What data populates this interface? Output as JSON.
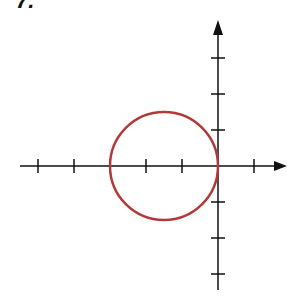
{
  "problem_label": "7.",
  "axes": {
    "origin_px": [
      218,
      166
    ],
    "unit_px": 36,
    "x_ticks": [
      -5,
      -4,
      -3,
      -2,
      -1,
      1
    ],
    "y_ticks": [
      3,
      2,
      1,
      -1,
      -2,
      -3
    ],
    "axis_color": "#111111"
  },
  "circle": {
    "center": [
      -1.5,
      0
    ],
    "radius": 1.5,
    "color": "#b03a3a"
  }
}
